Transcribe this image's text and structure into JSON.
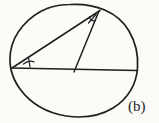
{
  "figure": {
    "label": "(b)"
  },
  "colors": {
    "ink": "#1f1f1f",
    "paper": "#fbfbf8"
  },
  "diagram": {
    "paths": {
      "circle": "M 70 4.5 C 95 3 118 12 129 31 C 136 43 138.5 55 137.5 68 C 136.5 84 128 99 113 108 C 99 116.5 83 118.5 66 116 C 48 113 31 104 20 89 C 12 78 8.5 66 10.5 52 C 13 34 28 16 47 8.5 C 55 5.5 62 4.5 70 4.5 Z",
      "chord": "M 12 68 L 137.5 70.5",
      "left_to_apex": "M 12 68 L 100 10.5",
      "apex_to_chord": "M 99 11 L 74 72",
      "left_angle_arc": "M 23.5 64 Q 29 59.5 34 62",
      "left_angle_tick": "M 28.5 57.5 L 30 67",
      "apex_angle_arc": "M 89.5 16.5 Q 90 22 95.5 20.5",
      "apex_angle_tick": "M 96 14.5 L 88.5 23"
    }
  }
}
